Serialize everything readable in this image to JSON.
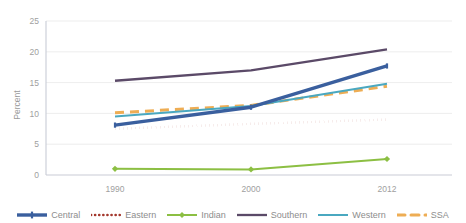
{
  "chart_data": {
    "type": "line",
    "title": "",
    "xlabel": "",
    "ylabel": "Percent",
    "x": [
      "1990",
      "2000",
      "2012"
    ],
    "categories": [
      "1990",
      "2000",
      "2012"
    ],
    "ylim": [
      0,
      25
    ],
    "yticks": [
      0,
      5,
      10,
      15,
      20,
      25
    ],
    "ytick_labels": [
      "0",
      "5",
      "10",
      "15",
      "20",
      "25"
    ],
    "grid": true,
    "legend_position": "bottom",
    "series": [
      {
        "name": "Central",
        "values": [
          8.1,
          11.0,
          17.7
        ],
        "color": "#3a5f9e",
        "style": "solid",
        "marker": "plus"
      },
      {
        "name": "Eastern",
        "values": [
          7.5,
          8.3,
          9.0
        ],
        "color": "#a3372c",
        "style": "dotted",
        "marker": "none"
      },
      {
        "name": "Indian",
        "values": [
          1.0,
          0.9,
          2.6
        ],
        "color": "#8cbf43",
        "style": "solid",
        "marker": "diamond"
      },
      {
        "name": "Southern",
        "values": [
          15.3,
          17.0,
          20.4
        ],
        "color": "#5b4a68",
        "style": "solid",
        "marker": "none"
      },
      {
        "name": "Western",
        "values": [
          9.5,
          11.2,
          14.8
        ],
        "color": "#4aa8c0",
        "style": "solid",
        "marker": "none"
      },
      {
        "name": "SSA",
        "values": [
          10.1,
          11.3,
          14.4
        ],
        "color": "#eead54",
        "style": "dashed",
        "marker": "none"
      }
    ]
  },
  "axis": {
    "y_title": "Percent",
    "y_ticks": [
      "25",
      "20",
      "15",
      "10",
      "5",
      "0"
    ],
    "x_ticks": [
      "1990",
      "2000",
      "2012"
    ]
  },
  "legend": {
    "items": [
      {
        "label": "Central"
      },
      {
        "label": "Eastern"
      },
      {
        "label": "Indian"
      },
      {
        "label": "Southern"
      },
      {
        "label": "Western"
      },
      {
        "label": "SSA"
      }
    ]
  }
}
